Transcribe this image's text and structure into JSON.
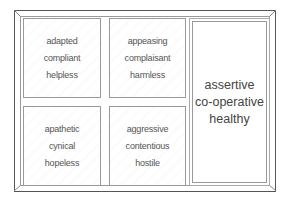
{
  "diagram": {
    "type": "framed-grid",
    "cells": [
      {
        "position": "top-left",
        "lines": [
          "adapted",
          "compliant",
          "helpless"
        ]
      },
      {
        "position": "top-middle",
        "lines": [
          "appeasing",
          "complaisant",
          "harmless"
        ]
      },
      {
        "position": "bottom-left",
        "lines": [
          "apathetic",
          "cynical",
          "hopeless"
        ]
      },
      {
        "position": "bottom-middle",
        "lines": [
          "aggressive",
          "contentious",
          "hostile"
        ]
      },
      {
        "position": "right-tall",
        "lines": [
          "assertive",
          "co-operative",
          "healthy"
        ]
      }
    ],
    "colors": {
      "frame": "#555555",
      "inner_lines": "#999999",
      "text": "#555555"
    }
  }
}
